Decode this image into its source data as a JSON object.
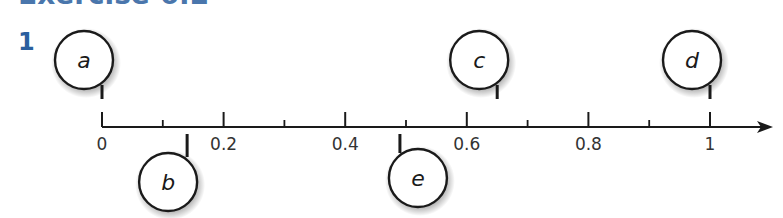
{
  "heading": "Exercise 6.2",
  "question_number": "1",
  "number_line": {
    "min": 0,
    "max": 1,
    "major_ticks": [
      {
        "value": 0,
        "label": "0"
      },
      {
        "value": 0.2,
        "label": "0.2"
      },
      {
        "value": 0.4,
        "label": "0.4"
      },
      {
        "value": 0.6,
        "label": "0.6"
      },
      {
        "value": 0.8,
        "label": "0.8"
      },
      {
        "value": 1,
        "label": "1"
      }
    ],
    "minor_ticks": [
      0.1,
      0.3,
      0.5,
      0.7,
      0.9
    ],
    "markers": [
      {
        "label": "a",
        "value": 0,
        "side": "above"
      },
      {
        "label": "b",
        "value": 0.14,
        "side": "below"
      },
      {
        "label": "c",
        "value": 0.65,
        "side": "above"
      },
      {
        "label": "d",
        "value": 1,
        "side": "above"
      },
      {
        "label": "e",
        "value": 0.49,
        "side": "below"
      }
    ]
  },
  "colors": {
    "accent": "#2b5f9e",
    "line": "#1a1a1a"
  }
}
